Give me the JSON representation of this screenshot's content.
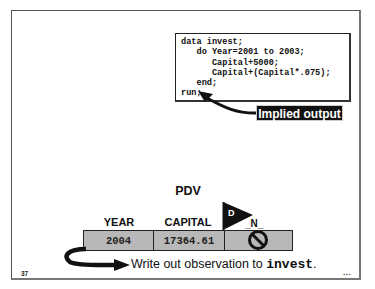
{
  "slide": {
    "page_number": "37",
    "continuation": "...",
    "code": {
      "lines": [
        "data invest;",
        "   do Year=2001 to 2003;",
        "      Capital+5000;",
        "      Capital+(Capital*.075);",
        "   end;",
        "run;"
      ]
    },
    "callout": "Implied output",
    "pdv": {
      "title": "PDV",
      "columns": [
        {
          "header": "YEAR",
          "value": "2004"
        },
        {
          "header": "CAPITAL",
          "value": "17364.61"
        },
        {
          "header": "_N_",
          "value": ""
        }
      ],
      "flag_label": "D",
      "n_icon": "no-symbol-icon"
    },
    "write_text": {
      "prefix": "Write out observation to ",
      "dataset": "invest",
      "suffix": "."
    }
  }
}
